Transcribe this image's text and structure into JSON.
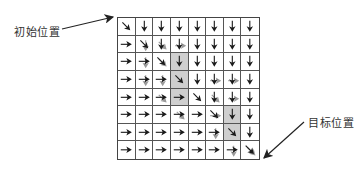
{
  "labels": {
    "start": "初始位置",
    "goal": "目标位置"
  },
  "grid": {
    "rows": 8,
    "cols": 8,
    "shaded_color": "#cfcfcf",
    "shaded_cells": [
      [
        2,
        3
      ],
      [
        3,
        3
      ],
      [
        4,
        3
      ],
      [
        5,
        6
      ],
      [
        6,
        6
      ]
    ],
    "arrows": [
      [
        "DR",
        "D",
        "D",
        "D",
        "D",
        "D",
        "D",
        "D"
      ],
      [
        "R",
        "DR",
        "D",
        "D",
        "D",
        "D",
        "D",
        "D"
      ],
      [
        "R",
        "R",
        "DR",
        "D",
        "D",
        "D",
        "D",
        "D"
      ],
      [
        "R",
        "R",
        "R",
        "DR",
        "D",
        "D",
        "D",
        "D"
      ],
      [
        "R",
        "R",
        "R",
        "R",
        "DR",
        "D",
        "D",
        "D"
      ],
      [
        "R",
        "R",
        "R",
        "R",
        "R",
        "DR",
        "D",
        "D"
      ],
      [
        "R",
        "R",
        "R",
        "R",
        "R",
        "R",
        "DR",
        "D"
      ],
      [
        "R",
        "R",
        "R",
        "R",
        "R",
        "R",
        "R",
        "DR"
      ]
    ],
    "ghost_arrows": [
      [
        1,
        1,
        "D"
      ],
      [
        1,
        2,
        "DR"
      ],
      [
        1,
        3,
        "R"
      ],
      [
        2,
        1,
        "D"
      ],
      [
        2,
        2,
        "DR"
      ],
      [
        3,
        1,
        "D"
      ],
      [
        3,
        2,
        "D"
      ],
      [
        3,
        5,
        "R"
      ],
      [
        3,
        6,
        "R"
      ],
      [
        4,
        2,
        "DR"
      ],
      [
        4,
        5,
        "DR"
      ],
      [
        4,
        6,
        "R"
      ],
      [
        5,
        3,
        "DR"
      ],
      [
        5,
        5,
        "R"
      ],
      [
        6,
        5,
        "D"
      ],
      [
        7,
        6,
        "D"
      ],
      [
        7,
        7,
        "DR"
      ]
    ]
  },
  "icons": {
    "start_pointer": "arrow-pointer-icon",
    "goal_pointer": "arrow-pointer-icon"
  }
}
